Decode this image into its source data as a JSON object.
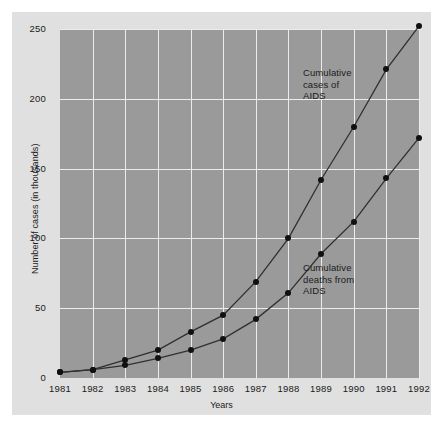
{
  "chart_data": {
    "type": "line",
    "title": "",
    "xlabel": "Years",
    "ylabel": "Number of cases (in thousands)",
    "categories": [
      "1981",
      "1982",
      "1983",
      "1984",
      "1985",
      "1986",
      "1987",
      "1988",
      "1989",
      "1990",
      "1991",
      "1992"
    ],
    "x": [
      1981,
      1982,
      1983,
      1984,
      1985,
      1986,
      1987,
      1988,
      1989,
      1990,
      1991,
      1992
    ],
    "xlim": [
      1981,
      1992
    ],
    "ylim": [
      0,
      250
    ],
    "yticks": [
      0,
      50,
      100,
      150,
      200,
      250
    ],
    "ytick_labels": [
      "0",
      "50",
      "100",
      "150",
      "200",
      "250"
    ],
    "grid": true,
    "legend_position": "inline-annotations",
    "series": [
      {
        "name": "Cumulative cases of AIDS",
        "values": [
          4,
          6,
          13,
          20,
          33,
          45,
          69,
          100,
          142,
          180,
          221,
          252
        ],
        "color": "#303030",
        "marker": "circle"
      },
      {
        "name": "Cumulative deaths from AIDS",
        "values": [
          4,
          6,
          9,
          14,
          20,
          28,
          42,
          61,
          89,
          112,
          143,
          172
        ],
        "color": "#303030",
        "marker": "circle"
      }
    ],
    "annotations": [
      {
        "text": "Cumulative\ncases of\nAIDS",
        "series": "Cumulative cases of AIDS"
      },
      {
        "text": "Cumulative\ndeaths from\nAIDS",
        "series": "Cumulative deaths from AIDS"
      }
    ],
    "colors": {
      "figure_background": "#ffffff",
      "panel_background": "#e0e0e0",
      "plot_background": "#9a9a9a",
      "gridline": "#ececec",
      "line": "#303030",
      "marker": "#101010",
      "text": "#1a1a1a"
    }
  }
}
